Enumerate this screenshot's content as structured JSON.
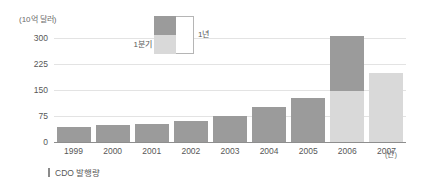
{
  "chart_data": {
    "type": "bar",
    "title": "",
    "subtitle": "",
    "xlabel": "년",
    "ylabel": "(10억 달러)",
    "unit_note": "(10억 달러)",
    "x_unit_note": "(년)",
    "categories": [
      "1999",
      "2000",
      "2001",
      "2002",
      "2003",
      "2004",
      "2005",
      "2006",
      "2007"
    ],
    "ylim": [
      0,
      300
    ],
    "yticks": [
      "0",
      "75",
      "150",
      "225",
      "300"
    ],
    "ytick_values": [
      0,
      75,
      150,
      225,
      300
    ],
    "grid": true,
    "stacked": true,
    "legend_position": "top-center",
    "series": [
      {
        "name": "1분기",
        "color": "#d9d9d9",
        "values": [
          0,
          0,
          0,
          0,
          0,
          0,
          0,
          148,
          200
        ]
      },
      {
        "name": "1년",
        "color": "#9b9b9b",
        "values": [
          43,
          49,
          52,
          61,
          75,
          100,
          128,
          157,
          0
        ]
      }
    ],
    "totals": [
      43,
      49,
      52,
      61,
      75,
      100,
      128,
      305,
      200
    ],
    "caption": "CDO 발행량"
  },
  "legend": {
    "quarter_label": "1분기",
    "year_label": "1년"
  },
  "caption": {
    "text": "CDO 발행량"
  },
  "colors": {
    "dark_bar": "#9b9b9b",
    "light_bar": "#d9d9d9",
    "gridline": "#e3e3e3",
    "axis": "#8e8e8e",
    "text": "#575757",
    "background": "#ffffff"
  }
}
